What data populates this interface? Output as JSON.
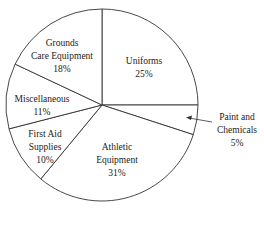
{
  "chart_data": {
    "type": "pie",
    "title": "",
    "slices": [
      {
        "label": "Uniforms",
        "value": 25,
        "pct_text": "25%"
      },
      {
        "label": "Paint and Chemicals",
        "value": 5,
        "pct_text": "5%"
      },
      {
        "label": "Athletic Equipment",
        "value": 31,
        "pct_text": "31%"
      },
      {
        "label": "First Aid Supplies",
        "value": 10,
        "pct_text": "10%"
      },
      {
        "label": "Miscellaneous",
        "value": 11,
        "pct_text": "11%"
      },
      {
        "label": "Grounds Care Equipment",
        "value": 18,
        "pct_text": "18%"
      }
    ],
    "start_angle": "12 o'clock",
    "direction": "clockwise"
  },
  "labels": {
    "uniforms": [
      "Uniforms",
      "25%"
    ],
    "paint": [
      "Paint and",
      "Chemicals",
      "5%"
    ],
    "athletic": [
      "Athletic",
      "Equipment",
      "31%"
    ],
    "firstaid": [
      "First Aid",
      "Supplies",
      "10%"
    ],
    "misc": [
      "Miscellaneous",
      "11%"
    ],
    "grounds": [
      "Grounds",
      "Care Equipment",
      "18%"
    ]
  },
  "style": {
    "line_color": "#333333",
    "fill": "#ffffff"
  }
}
